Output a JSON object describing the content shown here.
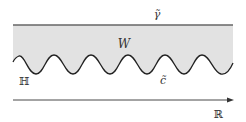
{
  "diagram": {
    "labels": {
      "gamma_tilde": "γ̃",
      "region_w": "W",
      "c_tilde": "c̃",
      "upper_half_plane": "ℍ",
      "real_line": "ℝ"
    },
    "colors": {
      "region_fill": "#e2e2e2",
      "top_line": "#666666",
      "wave_curve": "#222222",
      "axis": "#333333",
      "text": "#333333"
    }
  }
}
